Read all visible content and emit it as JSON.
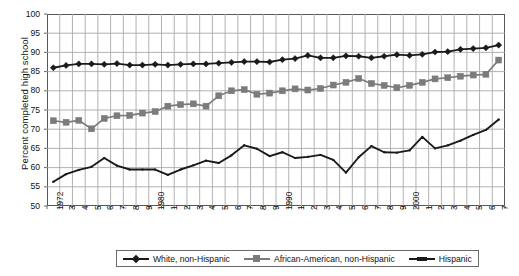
{
  "chart_data": {
    "type": "line",
    "title": "",
    "xlabel": "",
    "ylabel": "Percent completed high school",
    "ylim": [
      50,
      100
    ],
    "ytick_step": 5,
    "yticks": [
      100,
      95,
      90,
      85,
      80,
      75,
      70,
      65,
      60,
      55,
      50
    ],
    "grid": true,
    "legend_position": "bottom",
    "x": [
      1972,
      1973,
      1974,
      1975,
      1976,
      1977,
      1978,
      1979,
      1980,
      1981,
      1982,
      1983,
      1984,
      1985,
      1986,
      1987,
      1988,
      1989,
      1990,
      1991,
      1992,
      1993,
      1994,
      1995,
      1996,
      1997,
      1998,
      1999,
      2000,
      2001,
      2002,
      2003,
      2004,
      2005,
      2006,
      2007
    ],
    "xtick_labels": [
      "1972",
      "3",
      "4",
      "5",
      "6",
      "7",
      "8",
      "9",
      "1980",
      "1",
      "2",
      "3",
      "4",
      "5",
      "6",
      "7",
      "8",
      "9",
      "1990",
      "1",
      "2",
      "3",
      "4",
      "5",
      "6",
      "7",
      "8",
      "9",
      "2000",
      "1",
      "2",
      "3",
      "4",
      "5",
      "6",
      "7"
    ],
    "series": [
      {
        "name": "White, non-Hispanic",
        "marker": "diamond",
        "color": "#1a1a1a",
        "values": [
          86.0,
          86.6,
          87.0,
          87.0,
          86.9,
          87.1,
          86.7,
          86.7,
          86.9,
          86.7,
          86.9,
          87.0,
          87.0,
          87.2,
          87.4,
          87.6,
          87.6,
          87.5,
          88.1,
          88.4,
          89.2,
          88.6,
          88.6,
          89.1,
          89.0,
          88.6,
          89.0,
          89.4,
          89.2,
          89.5,
          90.1,
          90.2,
          90.8,
          91.0,
          91.2,
          91.9
        ],
        "label_format": "percent"
      },
      {
        "name": "African-American, non-Hispanic",
        "marker": "square",
        "color": "#7b7b7d",
        "values": [
          72.2,
          71.8,
          72.3,
          70.1,
          72.8,
          73.5,
          73.6,
          74.2,
          74.6,
          76.0,
          76.4,
          76.6,
          76.0,
          78.7,
          80.0,
          80.3,
          79.1,
          79.4,
          80.0,
          80.5,
          80.2,
          80.6,
          81.5,
          82.2,
          83.2,
          81.9,
          81.4,
          80.8,
          81.4,
          82.2,
          83.1,
          83.4,
          83.8,
          84.1,
          84.3,
          88.0
        ]
      },
      {
        "name": "Hispanic",
        "marker": "line",
        "color": "#1a1a1a",
        "values": [
          56.3,
          58.3,
          59.4,
          60.2,
          62.5,
          60.5,
          59.5,
          59.5,
          59.5,
          58.1,
          59.5,
          60.6,
          61.8,
          61.2,
          63.2,
          65.8,
          64.9,
          63.0,
          64.0,
          62.5,
          62.8,
          63.3,
          62.0,
          58.7,
          62.7,
          65.6,
          64.0,
          63.9,
          64.5,
          68.0,
          65.0,
          65.8,
          67.0,
          68.5,
          69.8,
          72.5
        ]
      }
    ]
  },
  "legend": {
    "entries": [
      {
        "label": "White, non-Hispanic"
      },
      {
        "label": "African-American, non-Hispanic"
      },
      {
        "label": "Hispanic"
      }
    ]
  },
  "colors": {
    "white_series": "#1a1a1a",
    "black_series": "#7b7b7d",
    "hispanic_series": "#1a1a1a",
    "grid": "#a9a9ab",
    "axis": "#58585a",
    "text": "#111111"
  }
}
